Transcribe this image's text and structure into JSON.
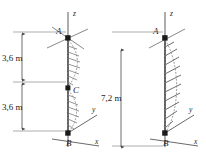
{
  "figure": {
    "background_color": "#ffffff",
    "line_color": "#4a4a4a",
    "axis_color": "#5a5a5a",
    "text_color": "#1c1c1c",
    "node_color": "#1a1a1a",
    "hatch_color": "#6e6e6e"
  },
  "diagram_left": {
    "name": "left-diagram",
    "dimensions": [
      {
        "label": "3,6 m",
        "from_point": "A",
        "to_point": "C"
      },
      {
        "label": "3,6 m",
        "from_point": "C",
        "to_point": "B"
      }
    ],
    "points": [
      {
        "label": "A",
        "role": "top-support"
      },
      {
        "label": "C",
        "role": "mid-point"
      },
      {
        "label": "B",
        "role": "base-origin"
      }
    ],
    "axes": [
      {
        "label": "z",
        "direction": "up"
      },
      {
        "label": "y",
        "direction": "up-right"
      },
      {
        "label": "x",
        "direction": "down-right"
      }
    ],
    "load": {
      "type": "distributed-load",
      "segments": 2,
      "shape": "curved-bulge",
      "description": "two bulging distributed load regions along member"
    }
  },
  "diagram_right": {
    "name": "right-diagram",
    "dimensions": [
      {
        "label": "7,2 m",
        "from_point": "A",
        "to_point": "B"
      }
    ],
    "points": [
      {
        "label": "A",
        "role": "top-support"
      },
      {
        "label": "B",
        "role": "base-origin"
      }
    ],
    "axes": [
      {
        "label": "z",
        "direction": "up"
      },
      {
        "label": "y",
        "direction": "up-right"
      },
      {
        "label": "x",
        "direction": "down-right"
      }
    ],
    "load": {
      "type": "distributed-load",
      "segments": 1,
      "shape": "curved-bulge",
      "description": "single bulging distributed load region spanning full length"
    }
  }
}
